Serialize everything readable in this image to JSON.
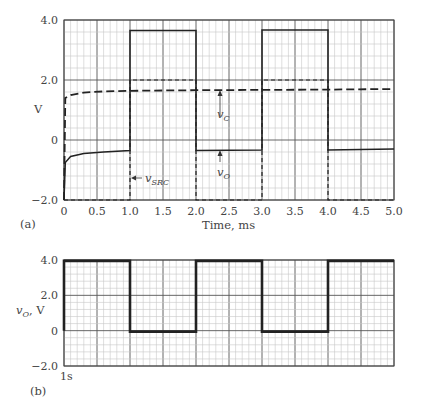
{
  "chart_data": [
    {
      "id": "a",
      "panel_label": "(a)",
      "type": "line",
      "title": "",
      "xlabel": "Time, ms",
      "ylabel": "V",
      "xlim": [
        0,
        5.0
      ],
      "ylim": [
        -2.0,
        4.0
      ],
      "x_ticks": [
        "0",
        "0.5",
        "1.0",
        "1.5",
        "2.0",
        "2.5",
        "3.0",
        "3.5",
        "4.0",
        "4.5",
        "5.0"
      ],
      "y_ticks": [
        "4.0",
        "2.0",
        "0",
        "−2.0"
      ],
      "grid": true,
      "series": [
        {
          "name": "v_SRC",
          "style": "dashed",
          "x": [
            0,
            1,
            1,
            2,
            2,
            3,
            3,
            4,
            4,
            5
          ],
          "y": [
            -2.0,
            -2.0,
            2.0,
            2.0,
            -2.0,
            -2.0,
            2.0,
            2.0,
            -2.0,
            -2.0
          ]
        },
        {
          "name": "v_C",
          "style": "dashed",
          "x": [
            0,
            0.02,
            0.1,
            0.3,
            0.6,
            1.0,
            2.0,
            3.0,
            4.0,
            5.0
          ],
          "y": [
            -2.0,
            1.4,
            1.5,
            1.58,
            1.62,
            1.64,
            1.66,
            1.67,
            1.68,
            1.7
          ]
        },
        {
          "name": "v_O",
          "style": "solid",
          "x": [
            0,
            0.02,
            0.1,
            0.3,
            0.6,
            1.0,
            1.0,
            2.0,
            2.0,
            3.0,
            3.0,
            4.0,
            4.0,
            5.0
          ],
          "y": [
            -2.0,
            -0.75,
            -0.55,
            -0.45,
            -0.4,
            -0.35,
            3.65,
            3.65,
            -0.35,
            -0.33,
            3.67,
            3.67,
            -0.33,
            -0.3
          ]
        }
      ],
      "annotations": [
        {
          "text": "v",
          "sub": "C",
          "target": "v_C dashed line",
          "arrow": "up"
        },
        {
          "text": "v",
          "sub": "O",
          "target": "v_O solid line",
          "arrow": "up"
        },
        {
          "text": "v",
          "sub": "SRC",
          "target": "v_SRC edge at 1.0 ms",
          "arrow": "left"
        }
      ]
    },
    {
      "id": "b",
      "panel_label": "(b)",
      "type": "line",
      "title": "",
      "xlabel": "",
      "ylabel": "v_O, V",
      "xlim": [
        0,
        5.0
      ],
      "ylim": [
        -2.0,
        4.0
      ],
      "x_ticks": [],
      "x_corner_label": "1s",
      "y_ticks": [
        "4.0",
        "2.0",
        "0",
        "−2.0"
      ],
      "grid": true,
      "series": [
        {
          "name": "v_O",
          "style": "solid-thick",
          "x": [
            0,
            0,
            1,
            1,
            2,
            2,
            3,
            3,
            4,
            4,
            5
          ],
          "y": [
            0,
            3.95,
            3.95,
            -0.05,
            -0.05,
            3.95,
            3.95,
            -0.05,
            -0.05,
            3.95,
            3.95
          ]
        }
      ]
    }
  ],
  "labels": {
    "a_panel": "(a)",
    "b_panel": "(b)",
    "a_xlabel": "Time, ms",
    "a_ylabel": "V",
    "b_ylabel_v": "v",
    "b_ylabel_sub": "O",
    "b_ylabel_unit": ", V",
    "b_corner": "1s",
    "ann_vc": "v",
    "ann_vc_sub": "C",
    "ann_vo": "v",
    "ann_vo_sub": "O",
    "ann_vsrc": "v",
    "ann_vsrc_sub": "SRC"
  }
}
